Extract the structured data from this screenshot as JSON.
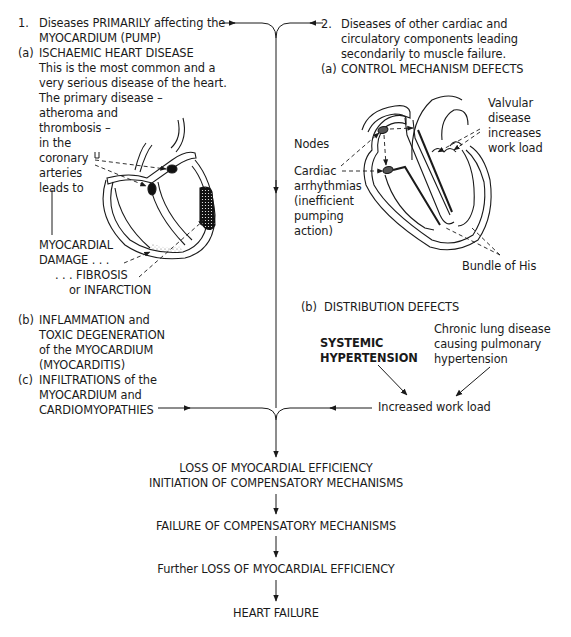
{
  "diagram": {
    "type": "flowchart"
  },
  "left_column": {
    "heading_num": "1.",
    "heading_line1": "Diseases PRIMARILY affecting the",
    "heading_line2": "MYOCARDIUM (PUMP)",
    "a": {
      "label": "(a)",
      "title": "ISCHAEMIC HEART DISEASE",
      "lines": [
        "This is the most common and a",
        "very serious disease of the heart.",
        "The primary disease –",
        "atheroma and",
        "thrombosis –",
        "in the",
        "coronary",
        "arteries",
        "leads to"
      ],
      "damage_lines": [
        "MYOCARDIAL",
        "DAMAGE . . .",
        ". . . FIBROSIS",
        "or INFARCTION"
      ]
    },
    "b": {
      "label": "(b)",
      "lines": [
        "INFLAMMATION and",
        "TOXIC DEGENERATION",
        "of the MYOCARDIUM",
        "(MYOCARDITIS)"
      ]
    },
    "c": {
      "label": "(c)",
      "lines": [
        "INFILTRATIONS of the",
        "MYOCARDIUM and",
        "CARDIOMYOPATHIES"
      ]
    }
  },
  "right_column": {
    "heading_num": "2.",
    "heading_lines": [
      "Diseases of other cardiac and",
      "circulatory components leading",
      "secondarily to muscle failure."
    ],
    "a": {
      "label": "(a)",
      "title": "CONTROL MECHANISM DEFECTS",
      "labels": {
        "valvular": [
          "Valvular",
          "disease",
          "increases",
          "work load"
        ],
        "nodes": "Nodes",
        "arrhythmias": [
          "Cardiac",
          "arrhythmias",
          "(inefficient",
          "pumping",
          "action)"
        ],
        "bundle": "Bundle of His"
      }
    },
    "b": {
      "label": "(b)",
      "title": "DISTRIBUTION DEFECTS",
      "systemic": [
        "SYSTEMIC",
        "HYPERTENSION"
      ],
      "chronic": [
        "Chronic lung disease",
        "causing pulmonary",
        "hypertension"
      ],
      "result": "Increased work load"
    }
  },
  "flow": {
    "steps": [
      "LOSS OF MYOCARDIAL EFFICIENCY",
      "INITIATION OF COMPENSATORY MECHANISMS",
      "FAILURE OF COMPENSATORY MECHANISMS",
      "Further LOSS OF MYOCARDIAL EFFICIENCY",
      "HEART FAILURE"
    ]
  },
  "colors": {
    "ink": "#1a1a1a",
    "infarct": "#111111",
    "septum_shade": "#e6e6e6"
  }
}
